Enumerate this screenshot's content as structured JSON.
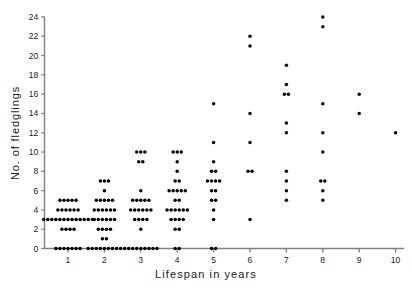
{
  "chart_data": {
    "type": "scatter",
    "title": "",
    "xlabel": "Lifespan in years",
    "ylabel": "No. of fledglings",
    "xlim": [
      0.45,
      10.55
    ],
    "ylim": [
      -1.0,
      25.0
    ],
    "xticks": [
      1,
      2,
      3,
      4,
      5,
      6,
      7,
      8,
      9,
      10
    ],
    "xticklabels": [
      "1",
      "2",
      "3",
      "4",
      "5",
      "6",
      "7",
      "8",
      "9",
      "10"
    ],
    "yticks": [
      0,
      2,
      4,
      6,
      8,
      10,
      12,
      14,
      16,
      18,
      20,
      22,
      24
    ],
    "yticklabels": [
      "0",
      "2",
      "4",
      "6",
      "8",
      "10",
      "12",
      "14",
      "16",
      "18",
      "20",
      "22",
      "24"
    ],
    "grid": false,
    "legend": false,
    "marker": "filled-circle",
    "marker_color": "#000000",
    "axis_color": "#808080",
    "series": [
      {
        "name": "individuals",
        "groups": [
          {
            "x": 1,
            "stacks": [
              {
                "y": 5,
                "count": 5
              },
              {
                "y": 4,
                "count": 6
              },
              {
                "y": 3,
                "count": 13
              },
              {
                "y": 2,
                "count": 4
              },
              {
                "y": 0,
                "count": 7
              }
            ]
          },
          {
            "x": 2,
            "stacks": [
              {
                "y": 7,
                "count": 3
              },
              {
                "y": 6,
                "count": 1
              },
              {
                "y": 5,
                "count": 5
              },
              {
                "y": 4,
                "count": 6
              },
              {
                "y": 3,
                "count": 6
              },
              {
                "y": 2,
                "count": 4
              },
              {
                "y": 1,
                "count": 2
              },
              {
                "y": 0,
                "count": 9
              }
            ]
          },
          {
            "x": 3,
            "stacks": [
              {
                "y": 10,
                "count": 3
              },
              {
                "y": 9,
                "count": 2
              },
              {
                "y": 6,
                "count": 1
              },
              {
                "y": 5,
                "count": 5
              },
              {
                "y": 4,
                "count": 6
              },
              {
                "y": 3,
                "count": 4
              },
              {
                "y": 2,
                "count": 1
              },
              {
                "y": 0,
                "count": 9
              }
            ]
          },
          {
            "x": 4,
            "stacks": [
              {
                "y": 10,
                "count": 3
              },
              {
                "y": 9,
                "count": 1
              },
              {
                "y": 8,
                "count": 1
              },
              {
                "y": 7,
                "count": 2
              },
              {
                "y": 6,
                "count": 5
              },
              {
                "y": 5,
                "count": 2
              },
              {
                "y": 4,
                "count": 6
              },
              {
                "y": 3,
                "count": 4
              },
              {
                "y": 2,
                "count": 2
              },
              {
                "y": 0,
                "count": 2
              }
            ]
          },
          {
            "x": 5,
            "stacks": [
              {
                "y": 15,
                "count": 1
              },
              {
                "y": 11,
                "count": 1
              },
              {
                "y": 9,
                "count": 1
              },
              {
                "y": 8,
                "count": 2
              },
              {
                "y": 7,
                "count": 4
              },
              {
                "y": 6,
                "count": 2
              },
              {
                "y": 5,
                "count": 2
              },
              {
                "y": 4,
                "count": 1
              },
              {
                "y": 3,
                "count": 1
              },
              {
                "y": 0,
                "count": 2
              }
            ]
          },
          {
            "x": 6,
            "stacks": [
              {
                "y": 22,
                "count": 1
              },
              {
                "y": 21,
                "count": 1
              },
              {
                "y": 14,
                "count": 1
              },
              {
                "y": 11,
                "count": 1
              },
              {
                "y": 8,
                "count": 2
              },
              {
                "y": 3,
                "count": 1
              }
            ]
          },
          {
            "x": 7,
            "stacks": [
              {
                "y": 19,
                "count": 1
              },
              {
                "y": 17,
                "count": 1
              },
              {
                "y": 16,
                "count": 2
              },
              {
                "y": 13,
                "count": 1
              },
              {
                "y": 12,
                "count": 1
              },
              {
                "y": 8,
                "count": 1
              },
              {
                "y": 7,
                "count": 1
              },
              {
                "y": 6,
                "count": 1
              },
              {
                "y": 5,
                "count": 1
              }
            ]
          },
          {
            "x": 8,
            "stacks": [
              {
                "y": 24,
                "count": 1
              },
              {
                "y": 23,
                "count": 1
              },
              {
                "y": 15,
                "count": 1
              },
              {
                "y": 12,
                "count": 1
              },
              {
                "y": 10,
                "count": 1
              },
              {
                "y": 7,
                "count": 2
              },
              {
                "y": 6,
                "count": 1
              },
              {
                "y": 5,
                "count": 1
              }
            ]
          },
          {
            "x": 9,
            "stacks": [
              {
                "y": 16,
                "count": 1
              },
              {
                "y": 14,
                "count": 1
              }
            ]
          },
          {
            "x": 10,
            "stacks": [
              {
                "y": 12,
                "count": 1
              }
            ]
          }
        ]
      }
    ]
  }
}
